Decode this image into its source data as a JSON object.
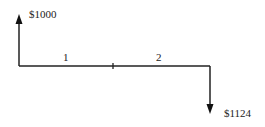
{
  "diagram": {
    "type": "cash-flow",
    "inflow": {
      "label": "$1000",
      "period": 0,
      "direction": "up"
    },
    "outflow": {
      "label": "$1124",
      "period": 2,
      "direction": "down"
    },
    "period_labels": [
      "1",
      "2"
    ]
  }
}
